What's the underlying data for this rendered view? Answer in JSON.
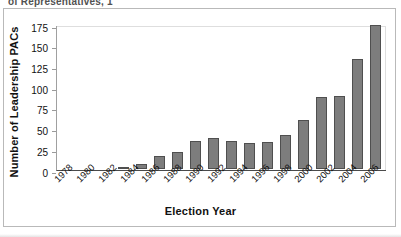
{
  "clipped_header_text": "of Representatives, 1",
  "chart_data": {
    "type": "bar",
    "title": "",
    "xlabel": "Election Year",
    "ylabel": "Number of Leadership PACs",
    "categories": [
      "1978",
      "1980",
      "1982",
      "1984",
      "1986",
      "1988",
      "1990",
      "1992",
      "1994",
      "1996",
      "1998",
      "2000",
      "2002",
      "2004",
      "2006"
    ],
    "values": [
      3,
      6,
      16,
      21,
      34,
      38,
      34,
      32,
      33,
      41,
      60,
      87,
      89,
      134,
      175
    ],
    "ylim": [
      0,
      175
    ],
    "yticks": [
      0,
      25,
      50,
      75,
      100,
      125,
      150,
      175
    ],
    "grid": false,
    "legend": "none",
    "bar_color": "#7d7d7d",
    "bar_border_color": "#4f4f4f",
    "axis_color": "#4a4a4a",
    "frame_color": "#b9b9b9"
  }
}
